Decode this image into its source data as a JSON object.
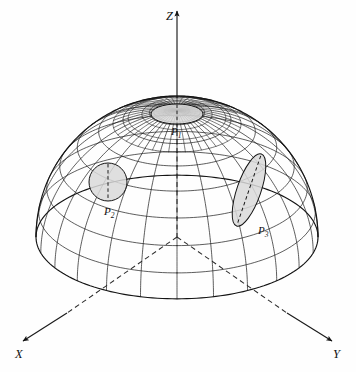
{
  "figure": {
    "kind": "3d-wireframe-hemisphere",
    "background_color": "#fefefe",
    "ink_color": "#1a1a1a",
    "patch_fill_color": "#d9d9d9"
  },
  "axes": {
    "z": {
      "label": "Z",
      "label_x": 166,
      "label_y": 20,
      "arrow_tip_x": 177,
      "arrow_tip_y": 11,
      "visible_from_y": 100,
      "hidden_to_y": 237,
      "style": "solid-above-dome, dashed-inside-dome"
    },
    "x": {
      "label": "X",
      "label_x": 15,
      "label_y": 358,
      "arrow_tip_x": 23,
      "arrow_tip_y": 341,
      "origin_x": 177,
      "origin_y": 237,
      "style": "dashed-inside-dome, solid-outside"
    },
    "y": {
      "label": "Y",
      "label_x": 333,
      "label_y": 358,
      "arrow_tip_x": 332,
      "arrow_tip_y": 341,
      "origin_x": 177,
      "origin_y": 237,
      "style": "dashed-inside-dome, solid-outside"
    }
  },
  "dome": {
    "center_x": 177,
    "center_y": 237,
    "radius_x": 141,
    "radius_y": 141,
    "pole_x": 177,
    "pole_y": 100,
    "equator_squash": 0.64,
    "tilt_deg": 26,
    "latitude_count": 8,
    "longitude_count": 24,
    "polar_cap_longitude_count": 48,
    "left_edge_x": 36,
    "right_edge_x": 318,
    "bottom_edge_y": 327,
    "top_edge_y": 96
  },
  "patches": [
    {
      "id": "P1",
      "label": "P",
      "subscript": "1",
      "label_x": 171,
      "label_y": 135,
      "shape": "ellipse",
      "cx": 177,
      "cy": 114,
      "rx": 26,
      "ry": 10,
      "rotation_deg": 0,
      "description": "shaded elliptical patch at the north pole region"
    },
    {
      "id": "P2",
      "label": "P",
      "subscript": "2",
      "label_x": 104,
      "label_y": 215,
      "shape": "circle",
      "cx": 108,
      "cy": 182,
      "rx": 19,
      "ry": 19,
      "rotation_deg": 0,
      "description": "shaded circular patch on the left flank"
    },
    {
      "id": "P3",
      "label": "P",
      "subscript": "3",
      "label_x": 258,
      "label_y": 234,
      "shape": "ellipse",
      "cx": 249,
      "cy": 190,
      "rx": 12,
      "ry": 38,
      "rotation_deg": 19,
      "description": "shaded elongated elliptical patch on the right flank"
    }
  ]
}
